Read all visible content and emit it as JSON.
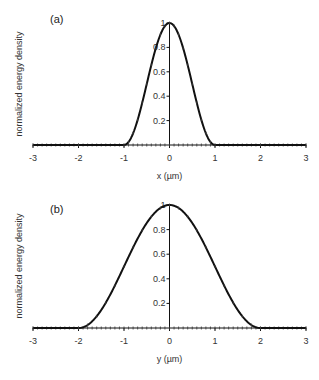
{
  "chart_data": [
    {
      "type": "line",
      "panel_label": "(a)",
      "title": "",
      "xlabel": "x (µm)",
      "ylabel": "normalized energy density",
      "xlim": [
        -3,
        3
      ],
      "ylim": [
        0,
        1
      ],
      "x_ticks": [
        "-3",
        "-2",
        "-1",
        "0",
        "1",
        "2",
        "3"
      ],
      "y_ticks": [
        "0.2",
        "0.4",
        "0.6",
        "0.8",
        "1"
      ],
      "grid": false,
      "legend": null,
      "series": [
        {
          "name": "energy density profile (x)",
          "x": [
            -3.0,
            -2.0,
            -1.0,
            -0.9,
            -0.8,
            -0.7,
            -0.6,
            -0.5,
            -0.4,
            -0.3,
            -0.2,
            -0.1,
            0.0,
            0.1,
            0.2,
            0.3,
            0.4,
            0.5,
            0.6,
            0.7,
            0.8,
            0.9,
            1.0,
            2.0,
            3.0
          ],
          "values": [
            0,
            0,
            0,
            0.024,
            0.095,
            0.206,
            0.345,
            0.5,
            0.655,
            0.794,
            0.905,
            0.976,
            1.0,
            0.976,
            0.905,
            0.794,
            0.655,
            0.5,
            0.345,
            0.206,
            0.095,
            0.024,
            0,
            0,
            0
          ]
        }
      ]
    },
    {
      "type": "line",
      "panel_label": "(b)",
      "title": "",
      "xlabel": "y (µm)",
      "ylabel": "normalized energy density",
      "xlim": [
        -3,
        3
      ],
      "ylim": [
        0,
        1
      ],
      "x_ticks": [
        "-3",
        "-2",
        "-1",
        "0",
        "1",
        "2",
        "3"
      ],
      "y_ticks": [
        "0.2",
        "0.4",
        "0.6",
        "0.8",
        "1"
      ],
      "grid": false,
      "legend": null,
      "series": [
        {
          "name": "energy density profile (y)",
          "x": [
            -3.0,
            -2.0,
            -1.8,
            -1.6,
            -1.4,
            -1.2,
            -1.0,
            -0.8,
            -0.6,
            -0.4,
            -0.2,
            0.0,
            0.2,
            0.4,
            0.6,
            0.8,
            1.0,
            1.2,
            1.4,
            1.6,
            1.8,
            2.0,
            3.0
          ],
          "values": [
            0,
            0,
            0.024,
            0.095,
            0.206,
            0.345,
            0.5,
            0.655,
            0.794,
            0.905,
            0.976,
            1.0,
            0.976,
            0.905,
            0.794,
            0.655,
            0.5,
            0.345,
            0.206,
            0.095,
            0.024,
            0,
            0
          ]
        }
      ]
    }
  ]
}
